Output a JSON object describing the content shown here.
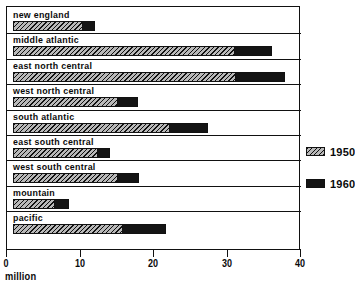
{
  "chart_data": {
    "type": "bar",
    "orientation": "horizontal",
    "title": "",
    "xlabel": "million",
    "ylabel": "",
    "xlim": [
      0,
      40
    ],
    "xticks": [
      0,
      10,
      20,
      30,
      40
    ],
    "xtick_labels": [
      "0",
      "10",
      "20",
      "30",
      "40"
    ],
    "grid": false,
    "legend_position": "right",
    "categories": [
      "new england",
      "middle atlantic",
      "east north central",
      "west north central",
      "south atlantic",
      "east south central",
      "west south central",
      "mountain",
      "pacific"
    ],
    "series": [
      {
        "name": "1950",
        "color": "#b9b9b9",
        "pattern": "diagonal-hatch",
        "values": [
          9.5,
          30.2,
          30.3,
          14.3,
          21.4,
          11.6,
          14.3,
          5.7,
          14.9
        ]
      },
      {
        "name": "1960",
        "color": "#141414",
        "pattern": "solid",
        "values": [
          11.2,
          35.2,
          37.0,
          17.0,
          26.5,
          13.2,
          17.1,
          7.6,
          20.8
        ]
      }
    ]
  },
  "axis": {
    "unit_label": "million",
    "ticks": [
      {
        "label": "0",
        "value": 0
      },
      {
        "label": "10",
        "value": 10
      },
      {
        "label": "20",
        "value": 20
      },
      {
        "label": "30",
        "value": 30
      },
      {
        "label": "40",
        "value": 40
      }
    ]
  },
  "legend": {
    "entries": [
      {
        "label": "1950",
        "swatch": "hatched-gray"
      },
      {
        "label": "1960",
        "swatch": "solid-black"
      }
    ]
  }
}
